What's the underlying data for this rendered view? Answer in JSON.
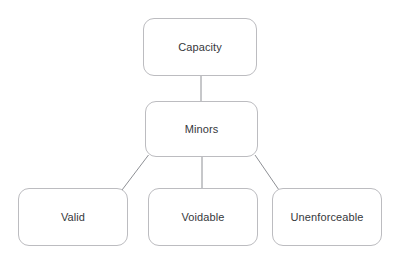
{
  "diagram": {
    "background_color": "#ffffff",
    "node_fill_color": "#ffffff",
    "node_border_color": "#bcbcc0",
    "connector_color": "#8e9095",
    "text_color": "#36383c",
    "nodes": [
      {
        "id": "capacity",
        "label": "Capacity",
        "level": 0
      },
      {
        "id": "minors",
        "label": "Minors",
        "level": 1
      },
      {
        "id": "valid",
        "label": "Valid",
        "level": 2
      },
      {
        "id": "voidable",
        "label": "Voidable",
        "level": 2
      },
      {
        "id": "unenforceable",
        "label": "Unenforceable",
        "level": 2
      }
    ],
    "connectors": [
      {
        "from": "capacity",
        "to": "valid",
        "kind": "vertical"
      },
      {
        "from": "minors",
        "to": "valid",
        "kind": "diagonal-left"
      },
      {
        "from": "minors",
        "to": "voidable",
        "kind": "vertical"
      },
      {
        "from": "minors",
        "to": "unenforceable",
        "kind": "diagonal-right"
      }
    ]
  }
}
